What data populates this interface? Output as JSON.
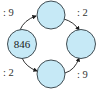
{
  "diagram": {
    "type": "operation-cycle",
    "colors": {
      "node_fill": "#c6e9f6",
      "node_stroke": "#2f3a40",
      "edge": "#1a1a1a"
    },
    "nodes": {
      "left": {
        "value": "846"
      },
      "top": {
        "value": ""
      },
      "right": {
        "value": ""
      },
      "bottom": {
        "value": ""
      }
    },
    "edges": {
      "left_to_top": {
        "op": ": 9"
      },
      "top_to_right": {
        "op": ": 2"
      },
      "left_to_bottom": {
        "op": ": 2"
      },
      "bottom_to_right": {
        "op": ": 9"
      }
    }
  }
}
